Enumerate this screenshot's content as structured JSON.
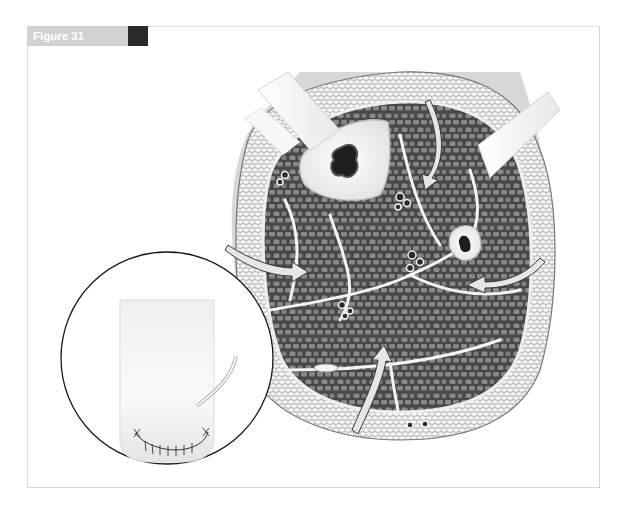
{
  "figure": {
    "label": "Figure 31",
    "accent_gray": "#d2d2d2",
    "accent_dark": "#2a2a2a"
  },
  "illustration": {
    "main": "cross-section-of-lower-leg-with-compartments",
    "inset": "closed-incision-with-sutures-and-drain",
    "arrows": 4,
    "incision-bars": 2
  }
}
